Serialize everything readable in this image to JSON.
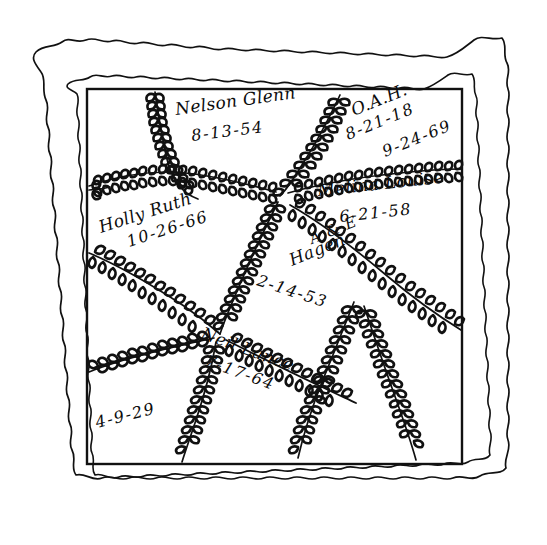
{
  "figure": {
    "colors": {
      "ink": "#111111",
      "background": "#ffffff"
    },
    "border": {
      "outer_scallop_label": "outer scalloped edge",
      "inner_scallop_label": "inner scalloped edge",
      "frame_label": "inner rectangular border"
    },
    "inscriptions": [
      {
        "id": "nelson-glenn",
        "name": "Nelson Glenn",
        "date": "8-13-54",
        "name_x": 176,
        "name_y": 115,
        "name_rotate": -8,
        "date_x": 192,
        "date_y": 141,
        "date_rotate": -7
      },
      {
        "id": "oah",
        "name": "O.A.H.",
        "date": "8-21-18",
        "name_x": 354,
        "name_y": 116,
        "name_rotate": -22,
        "date_x": 348,
        "date_y": 140,
        "date_rotate": -22
      },
      {
        "id": "oah-second-date",
        "name": "",
        "date": "9-24-69",
        "name_x": 0,
        "name_y": 0,
        "name_rotate": 0,
        "date_x": 385,
        "date_y": 157,
        "date_rotate": -22
      },
      {
        "id": "melina-louise",
        "name": "Melina Louise",
        "date": "6-21-58",
        "name_x": 318,
        "name_y": 196,
        "name_rotate": -6,
        "date_x": 340,
        "date_y": 222,
        "date_rotate": -6
      },
      {
        "id": "holly-ruth",
        "name": "Holly Ruth",
        "date": "10-26-66",
        "name_x": 101,
        "name_y": 233,
        "name_rotate": -18,
        "date_x": 129,
        "date_y": 247,
        "date_rotate": -18
      },
      {
        "id": "ae-hagen",
        "name": "Hagen",
        "initials": "A & E",
        "date": "2-14-53",
        "initials_x": 312,
        "initials_y": 244,
        "initials_rotate": -22,
        "name_x": 292,
        "name_y": 266,
        "name_rotate": -22,
        "date_x": 256,
        "date_y": 285,
        "date_rotate": 18
      },
      {
        "id": "neil-lance",
        "name": "Neil Lance",
        "date": "7-17-64",
        "name_x": 200,
        "name_y": 338,
        "name_rotate": 20,
        "date_x": 204,
        "date_y": 365,
        "date_rotate": 20
      },
      {
        "id": "bottom-left-date",
        "name": "",
        "date": "4-9-29",
        "name_x": 0,
        "name_y": 0,
        "name_rotate": 0,
        "date_x": 97,
        "date_y": 428,
        "date_rotate": -14
      }
    ]
  }
}
